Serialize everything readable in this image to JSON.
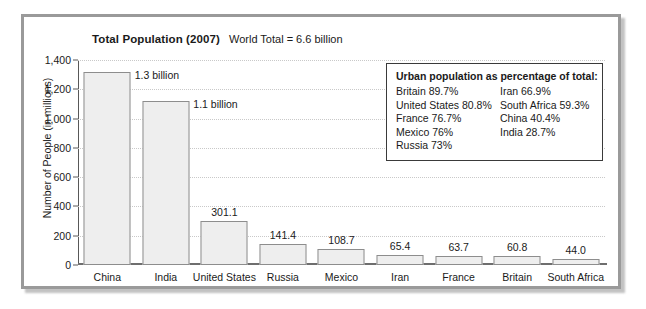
{
  "chart_data": {
    "type": "bar",
    "title": "Total Population (2007)",
    "subtitle": "World Total = 6.6 billion",
    "xlabel": "",
    "ylabel": "Number of People (in millions)",
    "ylim": [
      0,
      1400
    ],
    "ytick_labels": [
      "1,400",
      "1,200",
      "1,000",
      "800",
      "600",
      "400",
      "200",
      "0"
    ],
    "ytick_values": [
      1400,
      1200,
      1000,
      800,
      600,
      400,
      200,
      0
    ],
    "grid": true,
    "legend_position": "inside-top-right",
    "categories": [
      "China",
      "India",
      "United States",
      "Russia",
      "Mexico",
      "Iran",
      "France",
      "Britain",
      "South Africa"
    ],
    "values": [
      1320,
      1120,
      301.1,
      141.4,
      108.7,
      65.4,
      63.7,
      60.8,
      44.0
    ],
    "value_labels": [
      "1.3 billion",
      "1.1 billion",
      "301.1",
      "141.4",
      "108.7",
      "65.4",
      "63.7",
      "60.8",
      "44.0"
    ],
    "annotation": {
      "heading": "Urban population as percentage of total:",
      "column_left": [
        "Britain 89.7%",
        "United States 80.8%",
        "France 76.7%",
        "Mexico 76%",
        "Russia 73%"
      ],
      "column_right": [
        "Iran 66.9%",
        "South Africa 59.3%",
        "China 40.4%",
        "India 28.7%"
      ]
    },
    "colors": {
      "bar_fill": "#eeeeee",
      "bar_border": "#8d8d8d",
      "axis": "#585858",
      "gridline": "#c9c9c9",
      "frame": "#9a9a9a",
      "background": "#ffffff",
      "text": "#1a1a1a"
    }
  }
}
